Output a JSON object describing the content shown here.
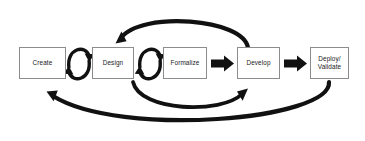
{
  "diagram": {
    "colors": {
      "arrow": "#111111",
      "box_border": "#8c8c8c",
      "box_fill": "#ffffff",
      "text": "#1a1a1a",
      "background": "#ffffff"
    },
    "nodes": [
      {
        "id": "create",
        "label": "Create",
        "x": 19,
        "y": 47,
        "w": 47,
        "h": 32
      },
      {
        "id": "design",
        "label": "Design",
        "x": 92,
        "y": 47,
        "w": 42,
        "h": 32
      },
      {
        "id": "formalize",
        "label": "Formalize",
        "x": 163,
        "y": 47,
        "w": 44,
        "h": 32
      },
      {
        "id": "develop",
        "label": "Develop",
        "x": 237,
        "y": 47,
        "w": 43,
        "h": 32
      },
      {
        "id": "deploy",
        "label": "Deploy/\nValidate",
        "x": 310,
        "y": 47,
        "w": 39,
        "h": 32
      }
    ],
    "connectors": [
      {
        "id": "cycle-create-design",
        "type": "oval-cycle",
        "from": "create",
        "to": "design"
      },
      {
        "id": "cycle-design-formalize",
        "type": "oval-cycle",
        "from": "design",
        "to": "formalize"
      },
      {
        "id": "block-formalize-develop",
        "type": "block-arrow",
        "from": "formalize",
        "to": "develop"
      },
      {
        "id": "block-develop-deploy",
        "type": "block-arrow",
        "from": "develop",
        "to": "deploy"
      },
      {
        "id": "feedback-top",
        "type": "curved-arrow",
        "from": "develop",
        "to": "design"
      },
      {
        "id": "feedback-inner-bottom",
        "type": "curved-arrow",
        "from": "design",
        "to": "develop"
      },
      {
        "id": "feedback-outer-bottom",
        "type": "curved-arrow",
        "from": "deploy",
        "to": "create"
      }
    ]
  }
}
